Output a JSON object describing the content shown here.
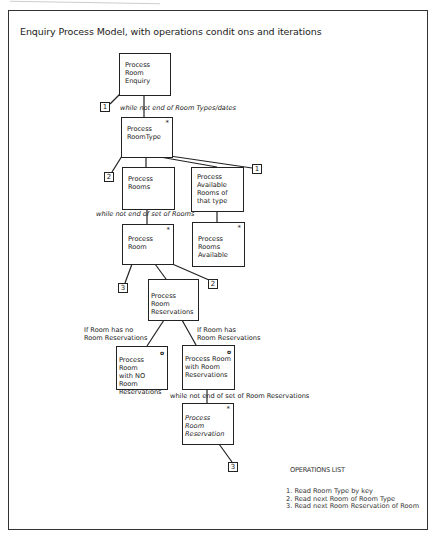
{
  "title": "Enquiry Process Model, with operations condit ons and iterations",
  "boxes": {
    "enquiry": {
      "lines": [
        "Process",
        "Room",
        "Enquiry"
      ],
      "marker": ""
    },
    "room_type": {
      "lines": [
        "Process",
        "RoomType"
      ],
      "marker": "*"
    },
    "rooms": {
      "lines": [
        "Process",
        "Rooms"
      ],
      "marker": ""
    },
    "available_of_type": {
      "lines": [
        "Process",
        "Available",
        "Rooms of",
        "that type"
      ],
      "marker": ""
    },
    "room": {
      "lines": [
        "Process",
        "Room"
      ],
      "marker": "*"
    },
    "rooms_available": {
      "lines": [
        "Process",
        "Rooms",
        "Available"
      ],
      "marker": "*"
    },
    "room_reservations": {
      "lines": [
        "Process Room",
        "Reservations"
      ],
      "marker": ""
    },
    "no_reservations": {
      "lines": [
        "Process Room",
        "with NO Room",
        "Reservations"
      ],
      "marker": "o"
    },
    "with_reservations": {
      "lines": [
        "Process Room",
        "with Room",
        "Reservations"
      ],
      "marker": "o"
    },
    "room_reservation": {
      "lines": [
        "Process Room",
        "Reservation"
      ],
      "marker": "*"
    }
  },
  "operation_labels": {
    "op_enquiry": "1",
    "op_roomtype_left": "2",
    "op_roomtype_right": "1",
    "op_room_left": "3",
    "op_room_right": "2",
    "op_reservation": "3"
  },
  "conditions": {
    "room_types": "while not end of Room Types/dates",
    "rooms": "while not end of set of Rooms",
    "no_reservations": [
      "If Room has no",
      "Room Reservations"
    ],
    "has_reservations": [
      "If Room has",
      "Room Reservations"
    ],
    "reservations": "while not end of set of Room Reservations"
  },
  "operations_list": {
    "heading": "OPERATIONS LIST",
    "items": [
      "1.  Read Room Type by key",
      "2.  Read next Room of Room Type",
      "3.  Read next Room Reservation of Room"
    ]
  }
}
